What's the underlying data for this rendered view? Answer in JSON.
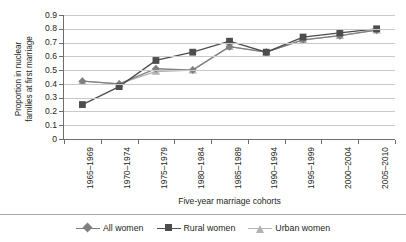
{
  "chart_data": {
    "type": "line",
    "title": "",
    "xlabel": "Five-year marriage cohorts",
    "ylabel": "Proportion in nuclear families at first marriage",
    "ylabel_line1": "Proportion in nuclear",
    "ylabel_line2": "families at first marriage",
    "categories": [
      "1965–1969",
      "1970–1974",
      "1975–1979",
      "1980–1984",
      "1985–1989",
      "1990–1994",
      "1995–1999",
      "2000–2004",
      "2005–2010"
    ],
    "yticks": [
      "0.9",
      "0.8",
      "0.7",
      "0.6",
      "0.5",
      "0.4",
      "0.3",
      "0.2",
      "0.1",
      "0"
    ],
    "ylim": [
      0,
      0.9
    ],
    "grid": true,
    "legend_position": "bottom",
    "series": [
      {
        "name": "All women",
        "marker": "diamond",
        "color": "#808080",
        "values": [
          0.42,
          0.4,
          0.51,
          0.5,
          0.67,
          0.63,
          0.72,
          0.75,
          0.79
        ]
      },
      {
        "name": "Rural women",
        "marker": "square",
        "color": "#4d4d4d",
        "values": [
          0.25,
          0.38,
          0.57,
          0.63,
          0.71,
          0.63,
          0.74,
          0.77,
          0.8
        ]
      },
      {
        "name": "Urban women",
        "marker": "triangle",
        "color": "#b3b3b3",
        "values": [
          0.42,
          0.4,
          0.49,
          0.5,
          0.67,
          0.63,
          0.72,
          0.75,
          0.79
        ]
      }
    ]
  },
  "colors": {
    "all_women": "#808080",
    "rural_women": "#4d4d4d",
    "urban_women": "#b3b3b3",
    "gridline": "#c9c9c9",
    "axis": "#6d6d6d",
    "text": "#231f20"
  }
}
